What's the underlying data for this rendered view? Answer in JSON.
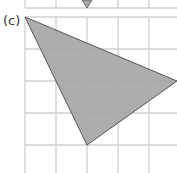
{
  "figure": {
    "label": "(c)",
    "colors": {
      "grid": "#cfcfcf",
      "fill": "#a6a6a6",
      "stroke": "#555555",
      "label": "#333333"
    },
    "grid": {
      "vertical_x": [
        25,
        56,
        87,
        118,
        149
      ],
      "horizontal_y": [
        17,
        49,
        81,
        113,
        145
      ],
      "top_partial_line_y": 8
    },
    "top_triangle_tip": {
      "x": 87,
      "y": 8
    },
    "triangle": {
      "vertices": [
        {
          "x": 25,
          "y": 17
        },
        {
          "x": 177,
          "y": 81
        },
        {
          "x": 87,
          "y": 145
        }
      ]
    }
  }
}
